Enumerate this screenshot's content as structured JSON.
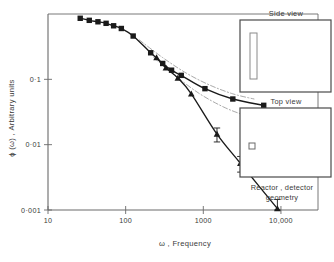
{
  "chart_data": {
    "type": "scatter",
    "title": "",
    "xlabel": "ω , Frequency",
    "ylabel": "ϕ (ω) , Arbitrary units",
    "xscale": "log",
    "yscale": "log",
    "xlim": [
      10,
      30000
    ],
    "ylim": [
      0.001,
      1.0
    ],
    "grid": false,
    "legend": "none",
    "x_ticks": [
      {
        "value": 10,
        "label": "10"
      },
      {
        "value": 100,
        "label": "100"
      },
      {
        "value": 1000,
        "label": "1000"
      },
      {
        "value": 10000,
        "label": "10,000"
      }
    ],
    "y_ticks": [
      {
        "value": 0.1,
        "label": "0·1"
      },
      {
        "value": 0.01,
        "label": "0·01"
      },
      {
        "value": 0.001,
        "label": "0·001"
      }
    ],
    "series": [
      {
        "name": "squares",
        "marker": "filled-square",
        "line": "solid",
        "points": [
          {
            "x": 26,
            "y": 0.86
          },
          {
            "x": 34,
            "y": 0.8
          },
          {
            "x": 44,
            "y": 0.76
          },
          {
            "x": 56,
            "y": 0.72
          },
          {
            "x": 70,
            "y": 0.66
          },
          {
            "x": 88,
            "y": 0.6
          },
          {
            "x": 125,
            "y": 0.46
          },
          {
            "x": 210,
            "y": 0.255
          },
          {
            "x": 300,
            "y": 0.175
          },
          {
            "x": 390,
            "y": 0.138
          },
          {
            "x": 520,
            "y": 0.115
          },
          {
            "x": 1050,
            "y": 0.072
          },
          {
            "x": 2400,
            "y": 0.05
          },
          {
            "x": 6000,
            "y": 0.04
          }
        ]
      },
      {
        "name": "triangles",
        "marker": "filled-triangle",
        "line": "solid",
        "points": [
          {
            "x": 250,
            "y": 0.215
          },
          {
            "x": 330,
            "y": 0.15
          },
          {
            "x": 470,
            "y": 0.105
          },
          {
            "x": 700,
            "y": 0.06
          },
          {
            "x": 1500,
            "y": 0.0145,
            "yerr": 0.0035
          },
          {
            "x": 3000,
            "y": 0.0052,
            "yerr": 0.0014
          },
          {
            "x": 9000,
            "y": 0.00105,
            "yerr": 0.0004
          }
        ]
      },
      {
        "name": "upper-reference-curve",
        "marker": "none",
        "line": "dash-dot",
        "points": [
          {
            "x": 150,
            "y": 0.4
          },
          {
            "x": 300,
            "y": 0.215
          },
          {
            "x": 600,
            "y": 0.125
          },
          {
            "x": 1200,
            "y": 0.082
          },
          {
            "x": 2400,
            "y": 0.06
          },
          {
            "x": 4500,
            "y": 0.05
          }
        ]
      },
      {
        "name": "lower-reference-curve",
        "marker": "none",
        "line": "dash-dot",
        "points": [
          {
            "x": 230,
            "y": 0.215
          },
          {
            "x": 450,
            "y": 0.11
          },
          {
            "x": 900,
            "y": 0.06
          },
          {
            "x": 1800,
            "y": 0.038
          },
          {
            "x": 3200,
            "y": 0.029
          },
          {
            "x": 4800,
            "y": 0.026
          }
        ]
      }
    ]
  },
  "insets": {
    "side_view": {
      "title": "Side view",
      "shape": "tall-narrow-rectangle"
    },
    "top_view": {
      "title": "Top view",
      "shape": "small-square"
    },
    "caption_line1": "Reactor , detector",
    "caption_line2": "geometry"
  },
  "colors": {
    "axis": "#555555",
    "data": "#1a1a1a",
    "reference": "#9a9a9a",
    "text": "#3a3a3a",
    "background": "#ffffff"
  }
}
